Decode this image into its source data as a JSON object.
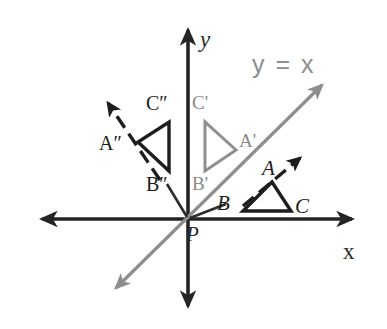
{
  "figure": {
    "type": "geometry-diagram",
    "background_color": "#ffffff"
  },
  "colors": {
    "axis": "#242424",
    "dark_ink": "#1d1d1d",
    "gray_ink": "#8a8a8a",
    "equation_text": "#8e8e8e"
  },
  "axes": {
    "x_label": "x",
    "y_label": "y",
    "origin_label": "P",
    "x_axis": {
      "x1": 38,
      "y1": 219,
      "x2": 356,
      "y2": 219,
      "double_arrow": true
    },
    "y_axis": {
      "x1": 188,
      "y1": 26,
      "x2": 188,
      "y2": 310,
      "double_arrow": true
    },
    "x_label_pos": {
      "left": 343,
      "top": 240
    },
    "y_label_pos": {
      "left": 200,
      "top": 28
    },
    "origin_label_pos": {
      "left": 186,
      "top": 224
    }
  },
  "mirror_line": {
    "equation_label": "y = x",
    "equation_pos": {
      "left": 252,
      "top": 52
    },
    "color": "#8e8e8e",
    "from": {
      "x": 113,
      "y": 291
    },
    "to": {
      "x": 325,
      "y": 82
    },
    "double_arrow": true
  },
  "triangles": [
    {
      "name": "triangle-abc",
      "style": "solid-dark",
      "stroke": "#1d1d1d",
      "stroke_width": 3.4,
      "vertices": [
        {
          "label": "A",
          "x": 272,
          "y": 182,
          "label_pos": {
            "left": 262,
            "top": 158
          },
          "label_class": "vertex-dark"
        },
        {
          "label": "B",
          "x": 243,
          "y": 211,
          "label_pos": {
            "left": 217,
            "top": 193
          },
          "label_class": "vertex-dark"
        },
        {
          "label": "C",
          "x": 291,
          "y": 211,
          "label_pos": {
            "left": 295,
            "top": 196
          },
          "label_class": "vertex-dark"
        }
      ]
    },
    {
      "name": "triangle-a-prime-b-prime-c-prime",
      "style": "solid-gray",
      "stroke": "#8f8f8f",
      "stroke_width": 3.0,
      "vertices": [
        {
          "label": "A'",
          "x": 236,
          "y": 150,
          "label_pos": {
            "left": 239,
            "top": 131
          },
          "label_class": "vertex-gray"
        },
        {
          "label": "B'",
          "x": 205,
          "y": 171,
          "label_pos": {
            "left": 192,
            "top": 174
          },
          "label_class": "vertex-gray"
        },
        {
          "label": "C'",
          "x": 205,
          "y": 122,
          "label_pos": {
            "left": 192,
            "top": 93
          },
          "label_class": "vertex-gray"
        }
      ]
    },
    {
      "name": "triangle-a-double-prime-b-double-prime-c-double-prime",
      "style": "solid-dark",
      "stroke": "#1d1d1d",
      "stroke_width": 3.4,
      "vertices": [
        {
          "label": "A″",
          "x": 138,
          "y": 142,
          "label_pos": {
            "left": 99,
            "top": 133
          },
          "label_class": "vertex-dark-prime"
        },
        {
          "label": "B″",
          "x": 169,
          "y": 171,
          "label_pos": {
            "left": 146,
            "top": 174
          },
          "label_class": "vertex-dark-prime"
        },
        {
          "label": "C″",
          "x": 169,
          "y": 122,
          "label_pos": {
            "left": 146,
            "top": 93
          },
          "label_class": "vertex-dark-prime"
        }
      ]
    }
  ],
  "motion_arrows": [
    {
      "name": "arrow-abc-to-a-prime",
      "style": "dashed-dark",
      "from": {
        "x": 243,
        "y": 206
      },
      "to": {
        "x": 300,
        "y": 158
      },
      "color": "#1d1d1d"
    },
    {
      "name": "arrow-a-prime-to-a-double-prime",
      "style": "dashed-dark",
      "from": {
        "x": 160,
        "y": 180
      },
      "to": {
        "x": 108,
        "y": 103
      },
      "color": "#1d1d1d"
    }
  ]
}
